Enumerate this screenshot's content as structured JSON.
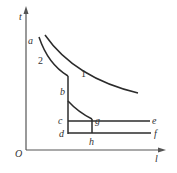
{
  "diagram": {
    "axes": {
      "y_label": "t",
      "x_label": "l",
      "origin_label": "O"
    },
    "curves": [
      {
        "id": "1",
        "label": "1"
      },
      {
        "id": "2",
        "label": "2"
      }
    ],
    "points": {
      "a": "a",
      "b": "b",
      "c": "c",
      "d": "d",
      "e": "e",
      "f": "f",
      "g": "g",
      "h": "h"
    },
    "colors": {
      "line": "#2b2b2b",
      "axis": "#555555"
    }
  }
}
